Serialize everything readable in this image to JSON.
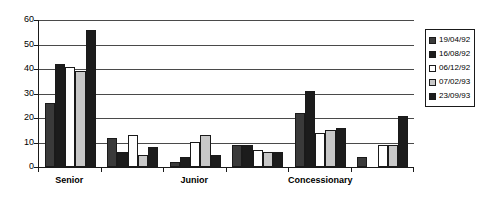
{
  "chart_data": {
    "type": "bar",
    "title": "",
    "xlabel": "",
    "ylabel": "",
    "ylim": [
      0,
      60
    ],
    "yticks": [
      0,
      10,
      20,
      30,
      40,
      50,
      60
    ],
    "grid": true,
    "legend_position": "right",
    "categories": [
      "Senior",
      "",
      "Junior",
      "",
      "Concessionary",
      ""
    ],
    "group_count": 6,
    "series": [
      {
        "name": "19/04/92",
        "color": "#3a3a3a",
        "values": [
          26,
          12,
          2,
          9,
          22,
          4
        ]
      },
      {
        "name": "16/08/92",
        "color": "#1c1c1c",
        "values": [
          42,
          6,
          4,
          9,
          31,
          0
        ]
      },
      {
        "name": "06/12/92",
        "color": "#ffffff",
        "values": [
          41,
          13,
          10,
          7,
          14,
          9
        ]
      },
      {
        "name": "07/02/93",
        "color": "#c8c8c8",
        "values": [
          39,
          5,
          13,
          6,
          15,
          9
        ]
      },
      {
        "name": "23/09/93",
        "color": "#1c1c1c",
        "values": [
          56,
          8,
          5,
          6,
          16,
          21
        ]
      }
    ]
  },
  "legend": {
    "items": [
      {
        "label": "19/04/92",
        "swatch": "dark-gray-swatch"
      },
      {
        "label": "16/08/92",
        "swatch": "black-swatch"
      },
      {
        "label": "06/12/92",
        "swatch": "white-swatch"
      },
      {
        "label": "07/02/93",
        "swatch": "light-gray-swatch"
      },
      {
        "label": "23/09/93",
        "swatch": "black-swatch"
      }
    ]
  },
  "axis": {
    "y_labels": [
      "60",
      "50",
      "40",
      "30",
      "20",
      "10",
      "0"
    ],
    "x_labels": [
      "Senior",
      "Junior",
      "Concessionary"
    ]
  }
}
